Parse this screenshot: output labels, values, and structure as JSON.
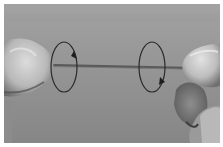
{
  "image": {
    "description": "Grayscale photo of two hands twisting a string in opposite directions, indicated by two oval rotation arrows",
    "colors": {
      "background_top": "#9a9a9a",
      "background_bottom": "#8a8a8a",
      "border": "#ffffff",
      "string": "#5a5a5a",
      "skin_light": "#d8d8d8",
      "skin_mid": "#b4b4b4",
      "skin_dark": "#5e5e5e",
      "arrow": "#2a2a2a"
    },
    "left_arrow": {
      "cx": 60,
      "cy": 63,
      "rx": 13,
      "ry": 25,
      "direction": "clockwise"
    },
    "right_arrow": {
      "cx": 148,
      "cy": 63,
      "rx": 13,
      "ry": 25,
      "direction": "counterclockwise"
    }
  }
}
